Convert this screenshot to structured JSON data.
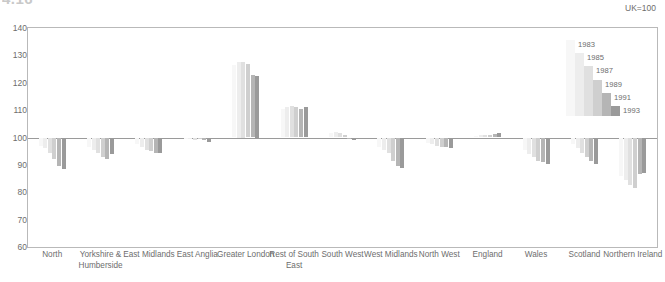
{
  "header": {
    "title": "4.16",
    "index_note": "UK=100"
  },
  "chart_data": {
    "type": "bar",
    "title": "4.16",
    "subtitle": "UK=100",
    "xlabel": "",
    "ylabel": "",
    "ylim": [
      60,
      140
    ],
    "yticks": [
      60,
      70,
      80,
      90,
      100,
      110,
      120,
      130,
      140
    ],
    "ytick_labels": [
      "60",
      "70",
      "80",
      "90",
      "100",
      "110",
      "120",
      "130",
      "140"
    ],
    "baseline": 100,
    "grid": false,
    "legend_position": "top-right",
    "categories": [
      "North",
      "Yorkshire & Humberside",
      "East Midlands",
      "East Anglia",
      "Greater London",
      "Rest of South East",
      "South West",
      "West Midlands",
      "North West",
      "England",
      "Wales",
      "Scotland",
      "Northern Ireland"
    ],
    "series": [
      {
        "name": "1983",
        "color": "#f7f7f7",
        "values": [
          97.0,
          96.5,
          97.5,
          99.5,
          126.5,
          110.5,
          101.5,
          96.5,
          98.0,
          100.5,
          95.5,
          97.5,
          86.0
        ]
      },
      {
        "name": "1985",
        "color": "#ededed",
        "values": [
          96.0,
          95.5,
          96.5,
          99.8,
          127.5,
          111.0,
          102.0,
          95.5,
          97.5,
          100.8,
          94.0,
          96.0,
          84.5
        ]
      },
      {
        "name": "1987",
        "color": "#e0e0e0",
        "values": [
          94.5,
          94.5,
          95.5,
          99.0,
          127.5,
          111.5,
          101.5,
          94.5,
          97.0,
          101.0,
          93.0,
          94.5,
          82.5
        ]
      },
      {
        "name": "1989",
        "color": "#cfcfcf",
        "values": [
          92.0,
          93.0,
          95.0,
          99.5,
          127.0,
          111.0,
          101.0,
          91.5,
          96.5,
          101.0,
          91.5,
          93.0,
          81.5
        ]
      },
      {
        "name": "1991",
        "color": "#b5b5b5",
        "values": [
          89.5,
          92.0,
          94.5,
          99.0,
          123.0,
          110.5,
          99.5,
          89.5,
          96.5,
          101.3,
          91.0,
          91.5,
          86.5
        ]
      },
      {
        "name": "1993",
        "color": "#9a9a9a",
        "values": [
          88.5,
          94.0,
          94.5,
          98.5,
          122.5,
          111.0,
          99.0,
          89.0,
          96.0,
          101.5,
          90.5,
          90.5,
          87.0
        ]
      }
    ],
    "legend_entries": [
      "1983",
      "1985",
      "1987",
      "1989",
      "1991",
      "1993"
    ]
  }
}
